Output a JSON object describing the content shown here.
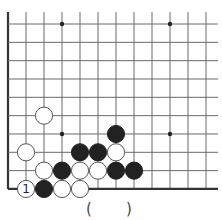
{
  "problem": {
    "answer_open": "(",
    "answer_close": ")"
  },
  "board": {
    "colors": {
      "line": "#6a6a6a",
      "edge": "#333333",
      "black": "#222222",
      "white": "#ffffff",
      "stroke": "#555555"
    },
    "grid": {
      "x0": 8,
      "y0": 24,
      "dx": 18,
      "dy": 18.33,
      "cols": 12,
      "rows": 10,
      "top_extend": 12,
      "right_extend": 218,
      "left_edge": true,
      "bottom_edge": true
    },
    "star_points": [
      {
        "col": 3,
        "row": 0
      },
      {
        "col": 9,
        "row": 0
      },
      {
        "col": 3,
        "row": 6
      },
      {
        "col": 9,
        "row": 6
      }
    ],
    "stones": [
      {
        "col": 2,
        "row": 5,
        "color": "white"
      },
      {
        "col": 6,
        "row": 6,
        "color": "black"
      },
      {
        "col": 1,
        "row": 7,
        "color": "white"
      },
      {
        "col": 4,
        "row": 7,
        "color": "black"
      },
      {
        "col": 5,
        "row": 7,
        "color": "black"
      },
      {
        "col": 6,
        "row": 7,
        "color": "white"
      },
      {
        "col": 2,
        "row": 8,
        "color": "white"
      },
      {
        "col": 3,
        "row": 8,
        "color": "black"
      },
      {
        "col": 4,
        "row": 8,
        "color": "white"
      },
      {
        "col": 5,
        "row": 8,
        "color": "white"
      },
      {
        "col": 6,
        "row": 8,
        "color": "black"
      },
      {
        "col": 7,
        "row": 8,
        "color": "black"
      },
      {
        "col": 1,
        "row": 9,
        "color": "white",
        "label": "1"
      },
      {
        "col": 2,
        "row": 9,
        "color": "black"
      },
      {
        "col": 3,
        "row": 9,
        "color": "white"
      },
      {
        "col": 4,
        "row": 9,
        "color": "white"
      }
    ]
  }
}
